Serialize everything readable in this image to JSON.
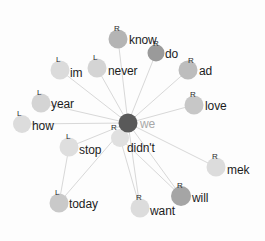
{
  "graph": {
    "title": "word association network",
    "center_node": {
      "id": "we",
      "label": "we",
      "tag": "R",
      "x": 128,
      "y": 123,
      "r": 9.5,
      "color": "#595959"
    },
    "edge_color": "#d8d8d8",
    "nodes": [
      {
        "id": "know",
        "label": "know",
        "tag": "R",
        "x": 118,
        "y": 39,
        "r": 9.5,
        "color": "#b4b4b4",
        "label_dx": 11,
        "label_dy": 4,
        "tag_dx": -4,
        "tag_dy": -14
      },
      {
        "id": "do",
        "label": "do",
        "tag": "R",
        "x": 156,
        "y": 53,
        "r": 8.5,
        "color": "#9a9a9a",
        "label_dx": 9,
        "label_dy": 4,
        "tag_dx": -3,
        "tag_dy": -13
      },
      {
        "id": "ad",
        "label": "ad",
        "tag": "R",
        "x": 188,
        "y": 70,
        "r": 9.5,
        "color": "#bdbdbd",
        "label_dx": 11,
        "label_dy": 4,
        "tag_dx": 0,
        "tag_dy": -13
      },
      {
        "id": "love",
        "label": "love",
        "tag": "R",
        "x": 194,
        "y": 105,
        "r": 9.5,
        "color": "#c7c7c7",
        "label_dx": 11,
        "label_dy": 4,
        "tag_dx": -4,
        "tag_dy": -14
      },
      {
        "id": "mek",
        "label": "mek",
        "tag": "R",
        "x": 216,
        "y": 167,
        "r": 9.5,
        "color": "#dcdcdc",
        "label_dx": 11,
        "label_dy": 6,
        "tag_dx": -4,
        "tag_dy": -14
      },
      {
        "id": "will",
        "label": "will",
        "tag": "R",
        "x": 181,
        "y": 196,
        "r": 10,
        "color": "#a5a5a5",
        "label_dx": 11,
        "label_dy": 5,
        "tag_dx": -4,
        "tag_dy": -14
      },
      {
        "id": "want",
        "label": "want",
        "tag": "R",
        "x": 140,
        "y": 208,
        "r": 9.5,
        "color": "#dcdcdc",
        "label_dx": 10,
        "label_dy": 6,
        "tag_dx": -4,
        "tag_dy": -14
      },
      {
        "id": "today",
        "label": "today",
        "tag": "L",
        "x": 59,
        "y": 203,
        "r": 9.5,
        "color": "#c9c9c9",
        "label_dx": 10,
        "label_dy": 4,
        "tag_dx": -4,
        "tag_dy": -14
      },
      {
        "id": "stop",
        "label": "stop",
        "tag": "L",
        "x": 69,
        "y": 147,
        "r": 9.5,
        "color": "#dedede",
        "label_dx": 10,
        "label_dy": 6,
        "tag_dx": -3,
        "tag_dy": -14
      },
      {
        "id": "how",
        "label": "how",
        "tag": "L",
        "x": 22,
        "y": 124,
        "r": 9,
        "color": "#dcdcdc",
        "label_dx": 10,
        "label_dy": 5,
        "tag_dx": -5,
        "tag_dy": -14
      },
      {
        "id": "year",
        "label": "year",
        "tag": "L",
        "x": 41,
        "y": 103,
        "r": 9.5,
        "color": "#d4d4d4",
        "label_dx": 10,
        "label_dy": 4,
        "tag_dx": -4,
        "tag_dy": -14
      },
      {
        "id": "im",
        "label": "im",
        "tag": "L",
        "x": 60,
        "y": 70,
        "r": 9.5,
        "color": "#dbdbdb",
        "label_dx": 10,
        "label_dy": 6,
        "tag_dx": -4,
        "tag_dy": -14
      },
      {
        "id": "never",
        "label": "never",
        "tag": "L",
        "x": 97,
        "y": 68,
        "r": 9.5,
        "color": "#d4d4d4",
        "label_dx": 11,
        "label_dy": 6,
        "tag_dx": -4,
        "tag_dy": -14
      },
      {
        "id": "didnt",
        "label": "didn't",
        "tag": "",
        "x": 120,
        "y": 138,
        "r": 9,
        "color": "#e0e0e0",
        "label_dx": 7,
        "label_dy": 13,
        "tag_dx": 0,
        "tag_dy": 0
      }
    ],
    "edges": [
      {
        "from": "we",
        "to": "know"
      },
      {
        "from": "we",
        "to": "do"
      },
      {
        "from": "we",
        "to": "ad"
      },
      {
        "from": "we",
        "to": "love"
      },
      {
        "from": "we",
        "to": "mek"
      },
      {
        "from": "we",
        "to": "will"
      },
      {
        "from": "we",
        "to": "want"
      },
      {
        "from": "we",
        "to": "today"
      },
      {
        "from": "we",
        "to": "stop"
      },
      {
        "from": "we",
        "to": "how"
      },
      {
        "from": "we",
        "to": "year"
      },
      {
        "from": "we",
        "to": "im"
      },
      {
        "from": "we",
        "to": "never"
      },
      {
        "from": "we",
        "to": "didnt"
      },
      {
        "from": "stop",
        "to": "today"
      },
      {
        "from": "didnt",
        "to": "want"
      },
      {
        "from": "didnt",
        "to": "will"
      }
    ]
  }
}
